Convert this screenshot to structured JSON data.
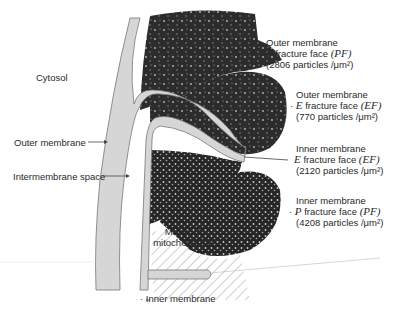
{
  "diagram": {
    "colors": {
      "fracture_face": "#2c2c2c",
      "membrane_space": "#d6d6d6",
      "matrix_hatch": "#9a9a9a",
      "background": "#ffffff"
    },
    "labels": {
      "cytosol": "Cytosol",
      "outer_membrane": "Outer membrane",
      "intermembrane_space": "Intermembrane space",
      "matrix_line1": "Matrix of",
      "matrix_line2": "mitochondrion",
      "inner_membrane": "Inner membrane"
    },
    "fracture_faces": [
      {
        "membrane": "Outer membrane",
        "face_letter": "P",
        "face_text": "fracture face",
        "abbr": "(PF)",
        "count": "(2806 particles /",
        "unit": "μm²)"
      },
      {
        "membrane": "Outer membrane",
        "face_letter": "E",
        "face_text": "fracture face",
        "abbr": "(EF)",
        "count": "(770 particles /",
        "unit": "μm²)"
      },
      {
        "membrane": "Inner membrane",
        "face_letter": "E",
        "face_text": "fracture face",
        "abbr": "(EF)",
        "count": "(2120 particles /",
        "unit": "μm²)"
      },
      {
        "membrane": "Inner membrane",
        "face_letter": "P",
        "face_text": "fracture face",
        "abbr": "(PF)",
        "count": "(4208 particles /",
        "unit": "μm²)"
      }
    ]
  }
}
